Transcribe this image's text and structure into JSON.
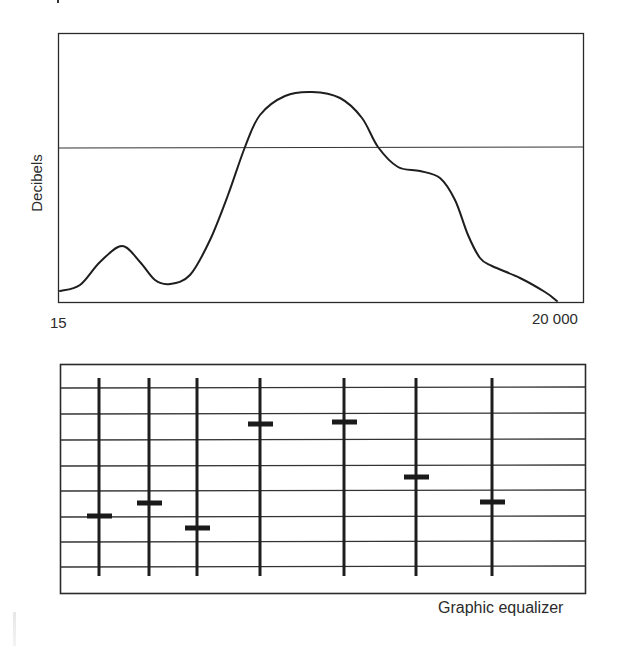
{
  "chart_data": [
    {
      "type": "line",
      "title": "",
      "xlabel": "",
      "ylabel": "Decibels",
      "x_tick_labels": [
        "15",
        "20 000"
      ],
      "x_scale": "log (frequency, Hz)",
      "reference_line": "horizontal mid-level line (0 dB)",
      "grid": false,
      "description": "Frequency response curve: low hump, trough, broad peak above reference, shoulder, then roll-off",
      "points_px": [
        [
          60,
          291
        ],
        [
          80,
          285
        ],
        [
          100,
          262
        ],
        [
          122,
          246
        ],
        [
          140,
          262
        ],
        [
          155,
          280
        ],
        [
          170,
          284
        ],
        [
          190,
          275
        ],
        [
          210,
          240
        ],
        [
          228,
          195
        ],
        [
          245,
          147
        ],
        [
          260,
          115
        ],
        [
          285,
          96
        ],
        [
          312,
          92
        ],
        [
          340,
          98
        ],
        [
          362,
          118
        ],
        [
          378,
          147
        ],
        [
          398,
          167
        ],
        [
          420,
          171
        ],
        [
          440,
          178
        ],
        [
          455,
          200
        ],
        [
          468,
          235
        ],
        [
          480,
          258
        ],
        [
          492,
          266
        ],
        [
          520,
          278
        ],
        [
          545,
          292
        ],
        [
          557,
          301
        ]
      ],
      "approx_relative_level": {
        "x_fraction": [
          0.0,
          0.12,
          0.21,
          0.35,
          0.48,
          0.61,
          0.69,
          0.83,
          1.0
        ],
        "level": [
          "low",
          "small hump",
          "trough",
          "crosses reference",
          "max peak",
          "crosses reference",
          "shoulder",
          "knee",
          "minimum"
        ]
      }
    },
    {
      "type": "diagram",
      "title": "Graphic equalizer",
      "slider_count": 7,
      "grid_lines": 8,
      "sliders": [
        {
          "index": 1,
          "x_px": 99,
          "knob_y_px": 516
        },
        {
          "index": 2,
          "x_px": 149,
          "knob_y_px": 503
        },
        {
          "index": 3,
          "x_px": 197,
          "knob_y_px": 528
        },
        {
          "index": 4,
          "x_px": 260,
          "knob_y_px": 424
        },
        {
          "index": 5,
          "x_px": 344,
          "knob_y_px": 422
        },
        {
          "index": 6,
          "x_px": 416,
          "knob_y_px": 477
        },
        {
          "index": 7,
          "x_px": 492,
          "knob_y_px": 502
        }
      ]
    }
  ],
  "top_chart": {
    "ylabel": "Decibels",
    "x_min_label": "15",
    "x_max_label": "20 000"
  },
  "bottom_chart": {
    "caption": "Graphic equalizer"
  },
  "colors": {
    "ink": "#222222",
    "background": "#ffffff"
  }
}
